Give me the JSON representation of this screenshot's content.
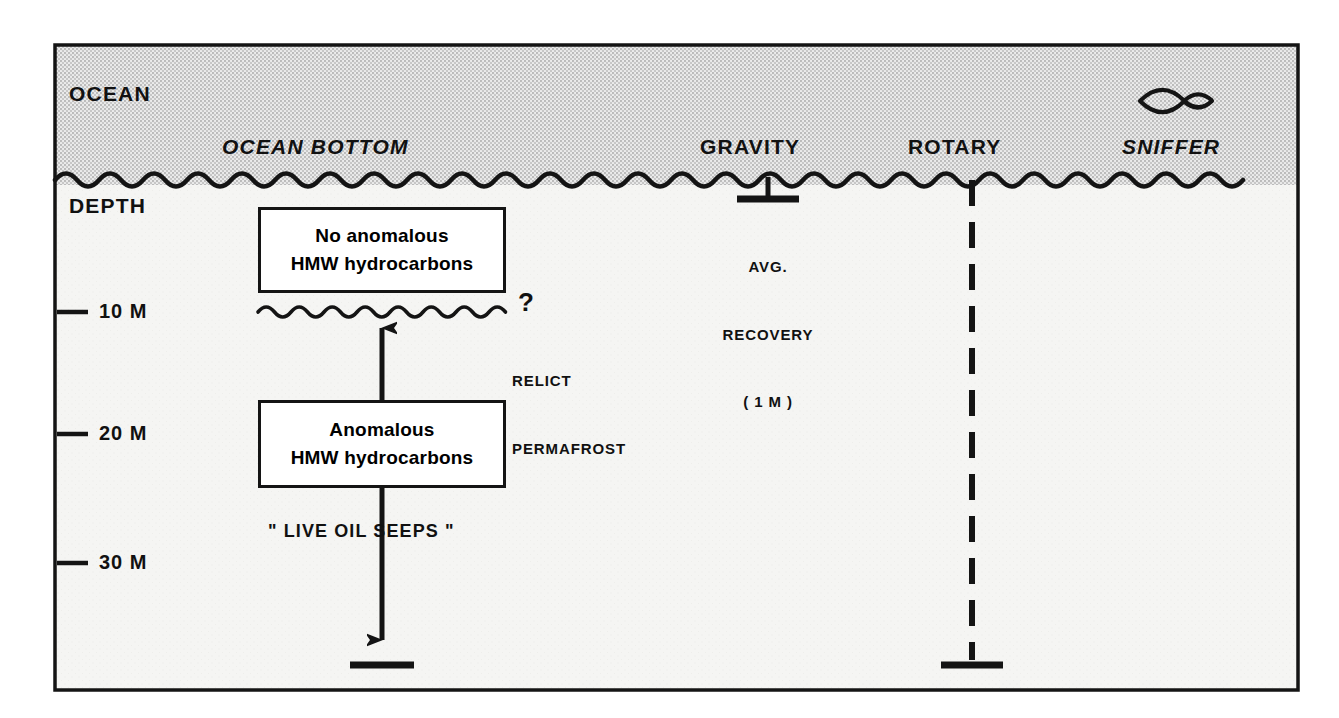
{
  "diagram": {
    "ocean_label": "OCEAN",
    "ocean_bottom_label": "OCEAN BOTTOM",
    "depth_axis_label": "DEPTH",
    "depth_ticks": [
      {
        "label": "10 M",
        "value": 10
      },
      {
        "label": "20 M",
        "value": 20
      },
      {
        "label": "30 M",
        "value": 30
      }
    ],
    "boxes": [
      {
        "name": "no-anomalous-box",
        "line1": "No anomalous",
        "line2": "HMW hydrocarbons"
      },
      {
        "name": "anomalous-box",
        "line1": "Anomalous",
        "line2": "HMW hydrocarbons"
      }
    ],
    "permafrost": {
      "question_mark": "?",
      "line1": "RELICT",
      "line2": "PERMAFROST"
    },
    "seeps_label": "\" LIVE OIL SEEPS \"",
    "methods": [
      {
        "name": "gravity",
        "label": "GRAVITY",
        "note_line1": "AVG.",
        "note_line2": "RECOVERY",
        "note_line3": "( 1 M )"
      },
      {
        "name": "rotary",
        "label": "ROTARY"
      },
      {
        "name": "sniffer",
        "label": "SNIFFER",
        "icon": "fish-icon"
      }
    ],
    "colors": {
      "ink": "#141414",
      "ocean_fill": "#d9d9d9",
      "sediment_fill": "#f4f4f2",
      "page": "#ffffff"
    }
  }
}
